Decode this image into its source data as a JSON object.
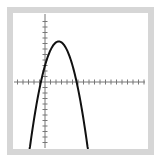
{
  "chart_data": {
    "type": "line",
    "title": "",
    "xlabel": "",
    "ylabel": "",
    "series": [
      {
        "name": "parabola",
        "equation_approx": "y = -0.7x^2 + 3.5x + 3",
        "vertex": [
          2.5,
          7.4
        ],
        "x_intercepts": [
          -0.7,
          5.7
        ],
        "y_intercept": 3,
        "color": "#111111"
      }
    ],
    "xlim": [
      -5.5,
      17.5
    ],
    "ylim": [
      -12.5,
      12.5
    ],
    "x_ticks_unit": 1,
    "y_ticks_unit": 1,
    "grid": false,
    "legend": "none",
    "axis_color": "#777777",
    "frame_color": "#d6d6d6"
  },
  "layout": {
    "origin_px": [
      45,
      82
    ],
    "unit_px_x": 5.5,
    "unit_px_y": 5.5
  }
}
